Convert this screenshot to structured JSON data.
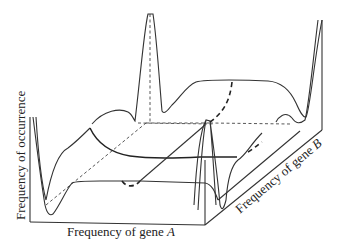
{
  "figure": {
    "type": "3d-surface-sketch",
    "axes": {
      "x_label": "Frequency of gene ",
      "x_label_var": "A",
      "y_label": "Frequency of gene ",
      "y_label_var": "B",
      "z_label": "Frequency of occurrence"
    },
    "colors": {
      "line": "#333333",
      "background": "#ffffff"
    }
  }
}
